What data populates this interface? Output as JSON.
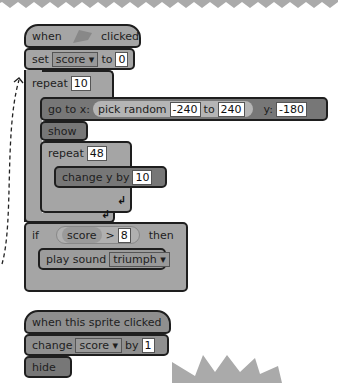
{
  "script1": {
    "hat": {
      "when": "when",
      "clicked": "clicked",
      "icon": "green-flag-icon"
    },
    "set": {
      "label": "set",
      "var": "score ▾",
      "to": "to",
      "value": "0"
    },
    "repeat_outer": {
      "label": "repeat",
      "count": "10"
    },
    "goto": {
      "label": "go to x:",
      "random": "pick random",
      "from": "-240",
      "to": "to",
      "to_val": "240",
      "y": "y:",
      "y_val": "-180"
    },
    "show": {
      "label": "show"
    },
    "repeat_inner": {
      "label": "repeat",
      "count": "48"
    },
    "change_y": {
      "label": "change y by",
      "value": "10"
    },
    "loop_arrow": "↲",
    "if": {
      "label": "if",
      "var": "score",
      "op": ">",
      "value": "8",
      "then": "then"
    },
    "play_sound": {
      "label": "play sound",
      "sound": "triumph ▾"
    }
  },
  "script2": {
    "hat": {
      "label": "when this sprite clicked"
    },
    "change": {
      "label": "change",
      "var": "score ▾",
      "by": "by",
      "value": "1"
    },
    "hide": {
      "label": "hide"
    }
  },
  "colors": {
    "control": "#a5a5a5",
    "motion": "#777777",
    "outline": "#1e1e1e",
    "decor": "#aaaaaa"
  }
}
